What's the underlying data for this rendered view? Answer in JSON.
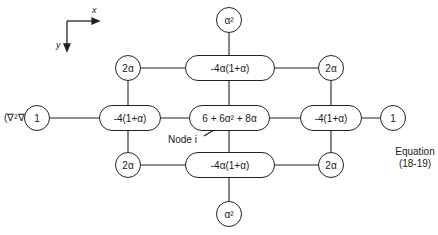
{
  "axes": {
    "x_label": "x",
    "y_label": "y"
  },
  "left_label": "(∇²∇²)ᵢ ≅",
  "nodes": {
    "top_far": "α²",
    "top_left_corner": "2α",
    "top_center": "-4α(1+α)",
    "top_right_corner": "2α",
    "mid_far_left": "1",
    "mid_left": "-4(1+α)",
    "center": "6 + 6α² + 8α",
    "mid_right": "-4(1+α)",
    "mid_far_right": "1",
    "bottom_left_corner": "2α",
    "bottom_center": "-4α(1+α)",
    "bottom_right_corner": "2α",
    "bottom_far": "α²"
  },
  "node_pointer_label": "Node i",
  "equation": {
    "line1": "Equation",
    "line2": "(18-19)"
  }
}
